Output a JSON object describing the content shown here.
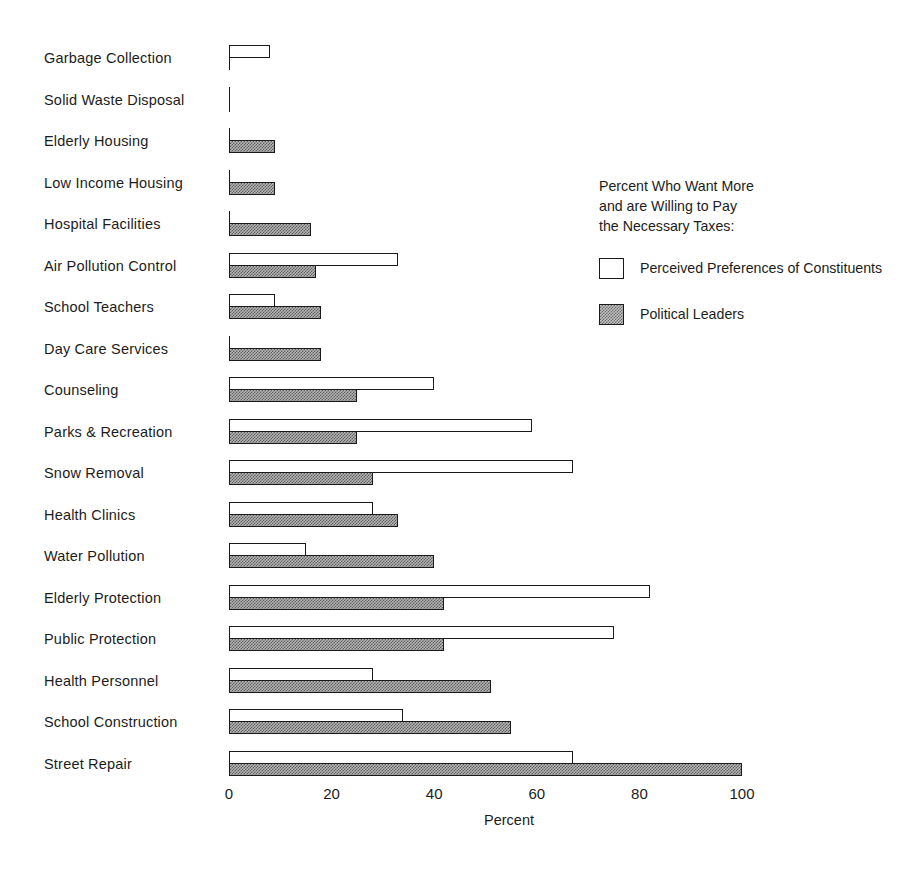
{
  "chart_data": {
    "type": "bar",
    "orientation": "horizontal",
    "grouped": true,
    "title": "",
    "xlabel": "Percent",
    "ylabel": "",
    "xlim": [
      0,
      100
    ],
    "xticks": [
      0,
      20,
      40,
      60,
      80,
      100
    ],
    "xtick_labels": [
      "0",
      "20",
      "40",
      "60",
      "80",
      "100"
    ],
    "grid": false,
    "legend_position": "right",
    "legend_title": "Percent Who Want More\nand are Willing to Pay\nthe Necessary Taxes:",
    "categories": [
      "Garbage Collection",
      "Solid Waste Disposal",
      "Elderly Housing",
      "Low Income Housing",
      "Hospital Facilities",
      "Air Pollution Control",
      "School Teachers",
      "Day Care Services",
      "Counseling",
      "Parks & Recreation",
      "Snow Removal",
      "Health Clinics",
      "Water Pollution",
      "Elderly Protection",
      "Public Protection",
      "Health Personnel",
      "School Construction",
      "Street Repair"
    ],
    "series": [
      {
        "name": "Perceived Preferences of Constituents",
        "style": "open",
        "values": [
          8,
          0,
          0,
          0,
          0,
          33,
          9,
          0,
          40,
          59,
          67,
          28,
          15,
          82,
          75,
          28,
          34,
          67
        ]
      },
      {
        "name": "Political Leaders",
        "style": "shaded",
        "values": [
          0,
          0,
          9,
          9,
          16,
          17,
          18,
          18,
          25,
          25,
          28,
          33,
          40,
          42,
          42,
          51,
          55,
          100
        ]
      }
    ]
  },
  "legend": {
    "title_line_1": "Percent Who Want More",
    "title_line_2": "and are Willing to Pay",
    "title_line_3": "the Necessary Taxes:",
    "entries": [
      {
        "label": "Perceived Preferences of Constituents",
        "style": "open"
      },
      {
        "label": "Political Leaders",
        "style": "shaded"
      }
    ]
  },
  "axis": {
    "x_title": "Percent",
    "tick_labels": [
      "0",
      "20",
      "40",
      "60",
      "80",
      "100"
    ]
  },
  "colors": {
    "ink": "#1a1a1a",
    "open_fill": "#ffffff",
    "shaded_fill": "#b5b5b5",
    "background": "#ffffff"
  }
}
